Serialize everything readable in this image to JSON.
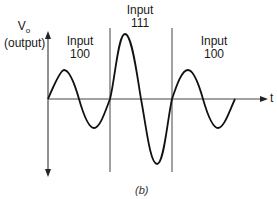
{
  "figure": {
    "y_axis_label_line1": "V",
    "y_axis_label_sub": "o",
    "y_axis_label_line2": "(output)",
    "x_axis_label": "t",
    "caption": "(b)",
    "segments": [
      {
        "label_line1": "Input",
        "label_line2": "100",
        "amplitude": "small"
      },
      {
        "label_line1": "Input",
        "label_line2": "111",
        "amplitude": "large"
      },
      {
        "label_line1": "Input",
        "label_line2": "100",
        "amplitude": "small"
      }
    ]
  }
}
